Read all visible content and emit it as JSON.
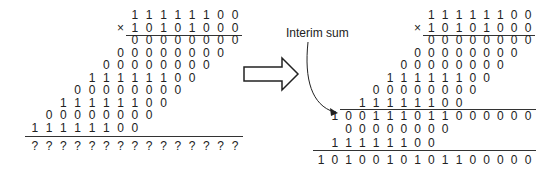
{
  "left": {
    "multiplicand": "11111100",
    "multiplier": "10101000",
    "times_sign": "×",
    "partial_products": [
      {
        "bits": "00000000",
        "shift": 0
      },
      {
        "bits": "00000000",
        "shift": 1
      },
      {
        "bits": "00000000",
        "shift": 2
      },
      {
        "bits": "11111100",
        "shift": 3
      },
      {
        "bits": "00000000",
        "shift": 4
      },
      {
        "bits": "11111100",
        "shift": 5
      },
      {
        "bits": "00000000",
        "shift": 6
      },
      {
        "bits": "11111100",
        "shift": 7
      }
    ],
    "result": "???????????????"
  },
  "arrow_label": "Interim sum",
  "right": {
    "multiplicand": "11111100",
    "multiplier": "10101000",
    "times_sign": "×",
    "partial_products_before": [
      {
        "bits": "00000000",
        "shift": 0
      },
      {
        "bits": "00000000",
        "shift": 1
      },
      {
        "bits": "00000000",
        "shift": 2
      },
      {
        "bits": "11111100",
        "shift": 3
      },
      {
        "bits": "00000000",
        "shift": 4
      },
      {
        "bits": "11111100",
        "shift": 5
      }
    ],
    "interim_sum": "100111011000000",
    "partial_products_after": [
      {
        "bits": "00000000",
        "shift": 6
      },
      {
        "bits": "11111100",
        "shift": 7
      }
    ],
    "result": "1010010101100000"
  }
}
